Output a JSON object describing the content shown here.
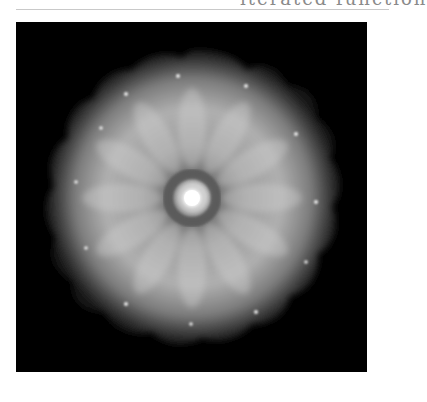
{
  "header": {
    "clipped_text": "iterated function"
  },
  "figure": {
    "background_color": "#000000",
    "symmetry_order": 12,
    "colors": {
      "outer_glow": "#3a3a3a",
      "body": "#9a9a9a",
      "ring": "#5e5e5e",
      "core": "#ffffff"
    }
  }
}
